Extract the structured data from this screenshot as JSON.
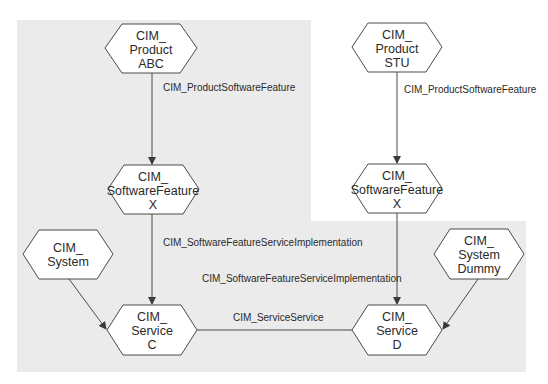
{
  "diagram": {
    "background_color": "#ffffff",
    "region_color": "#ebebeb",
    "line_color": "#4a4a4a",
    "nodes": [
      {
        "id": "product-abc",
        "lines": [
          "CIM_",
          "Product",
          "ABC"
        ]
      },
      {
        "id": "softwarefeature-x-left",
        "lines": [
          "CIM_",
          "SoftwareFeature",
          "X"
        ]
      },
      {
        "id": "product-stu",
        "lines": [
          "CIM_",
          "Product",
          "STU"
        ]
      },
      {
        "id": "softwarefeature-x-right",
        "lines": [
          "CIM_",
          "SoftwareFeature",
          "X"
        ]
      },
      {
        "id": "system",
        "lines": [
          "CIM_",
          "System"
        ]
      },
      {
        "id": "system-dummy",
        "lines": [
          "CIM_",
          "System",
          "Dummy"
        ]
      },
      {
        "id": "service-c",
        "lines": [
          "CIM_",
          "Service",
          "C"
        ]
      },
      {
        "id": "service-d",
        "lines": [
          "CIM_",
          "Service",
          "D"
        ]
      }
    ],
    "edges": [
      {
        "from": "product-abc",
        "to": "softwarefeature-x-left",
        "label": "CIM_ProductSoftwareFeature",
        "arrow": true
      },
      {
        "from": "product-stu",
        "to": "softwarefeature-x-right",
        "label": "CIM_ProductSoftwareFeature",
        "arrow": true
      },
      {
        "from": "softwarefeature-x-left",
        "to": "service-c",
        "label": "CIM_SoftwareFeatureServiceImplementation",
        "arrow": true
      },
      {
        "from": "softwarefeature-x-right",
        "to": "service-d",
        "label": "CIM_SoftwareFeatureServiceImplementation",
        "arrow": true
      },
      {
        "from": "system",
        "to": "service-c",
        "label": "",
        "arrow": true
      },
      {
        "from": "system-dummy",
        "to": "service-d",
        "label": "",
        "arrow": true
      },
      {
        "from": "service-c",
        "to": "service-d",
        "label": "CIM_ServiceService",
        "arrow": false
      }
    ]
  }
}
